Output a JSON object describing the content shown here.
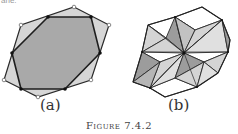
{
  "top_fragment": "ane.",
  "figure": {
    "caption": "Figure 7.4.2",
    "panels": [
      {
        "id": "a",
        "label": "(a)",
        "description": "Hexagon inscribed in a larger hexagon; outer vertices open circles, inner vertices filled dots",
        "outer_polygon": [
          [
            74,
            7
          ],
          [
            109,
            25
          ],
          [
            91,
            80
          ],
          [
            38,
            97
          ],
          [
            4,
            80
          ],
          [
            21,
            25
          ]
        ],
        "inner_polygon": [
          [
            48,
            17
          ],
          [
            91,
            17
          ],
          [
            100,
            53
          ],
          [
            65,
            89
          ],
          [
            21,
            89
          ],
          [
            12,
            53
          ]
        ],
        "colors": {
          "outer_fill": "#d6d6d6",
          "inner_fill": "#a9a9a9",
          "stroke": "#2a2a2a"
        }
      },
      {
        "id": "b",
        "label": "(b)",
        "description": "Hexagonal tiling made of rhombi subdivided into light, dark and white triangles around a central point",
        "center": [
          184,
          53
        ],
        "colors": {
          "light": "#d4d4d4",
          "dark": "#9c9c9c",
          "white": "#ffffff",
          "stroke": "#2a2a2a"
        }
      }
    ]
  }
}
